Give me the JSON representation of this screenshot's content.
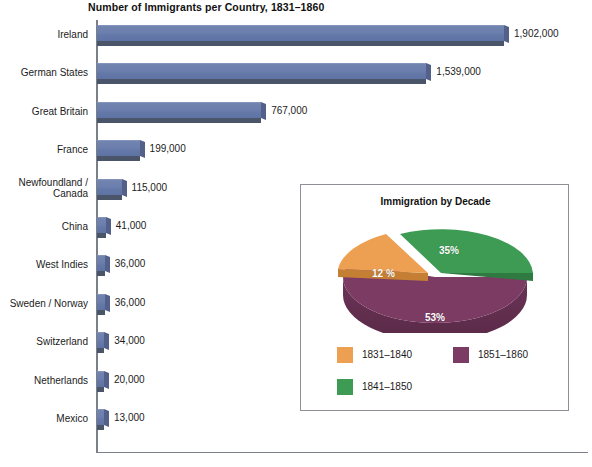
{
  "chart_data": [
    {
      "type": "bar",
      "orientation": "horizontal",
      "title": "Number of Immigrants per Country, 1831–1860",
      "xlabel": "",
      "ylabel": "",
      "categories": [
        "Ireland",
        "German States",
        "Great Britain",
        "France",
        "Newfoundland /\nCanada",
        "China",
        "West Indies",
        "Sweden / Norway",
        "Switzerland",
        "Netherlands",
        "Mexico"
      ],
      "values": [
        1902000,
        1539000,
        767000,
        199000,
        115000,
        41000,
        36000,
        36000,
        34000,
        20000,
        13000
      ],
      "value_labels": [
        "1,902,000",
        "1,539,000",
        "767,000",
        "199,000",
        "115,000",
        "41,000",
        "36,000",
        "36,000",
        "34,000",
        "20,000",
        "13,000"
      ],
      "xlim": [
        0,
        2000000
      ],
      "grid": false,
      "bar_color": "#6B7EAD",
      "bar_shadow_color": "#4B5569"
    },
    {
      "type": "pie",
      "title": "Immigration by Decade",
      "labels": [
        "1831–1840",
        "1841–1850",
        "1851–1860"
      ],
      "values": [
        12,
        35,
        53
      ],
      "value_labels": [
        "12 %",
        "35%",
        "53%"
      ],
      "colors": [
        "#EDA052",
        "#3D9B54",
        "#7B3B63"
      ],
      "legend_position": "bottom",
      "exploded": [
        "1831–1840",
        "1841–1850"
      ]
    }
  ],
  "main": {
    "title": "Number of Immigrants per Country, 1831–1860",
    "bars": [
      {
        "label": "Ireland",
        "label_line1": "Ireland",
        "label_line2": "",
        "value": "1,902,000",
        "num": 1902000
      },
      {
        "label": "German States",
        "label_line1": "German States",
        "label_line2": "",
        "value": "1,539,000",
        "num": 1539000
      },
      {
        "label": "Great Britain",
        "label_line1": "Great Britain",
        "label_line2": "",
        "value": "767,000",
        "num": 767000
      },
      {
        "label": "France",
        "label_line1": "France",
        "label_line2": "",
        "value": "199,000",
        "num": 199000
      },
      {
        "label": "Newfoundland / Canada",
        "label_line1": "Newfoundland /",
        "label_line2": "Canada",
        "value": "115,000",
        "num": 115000
      },
      {
        "label": "China",
        "label_line1": "China",
        "label_line2": "",
        "value": "41,000",
        "num": 41000
      },
      {
        "label": "West Indies",
        "label_line1": "West Indies",
        "label_line2": "",
        "value": "36,000",
        "num": 36000
      },
      {
        "label": "Sweden / Norway",
        "label_line1": "Sweden / Norway",
        "label_line2": "",
        "value": "36,000",
        "num": 36000
      },
      {
        "label": "Switzerland",
        "label_line1": "Switzerland",
        "label_line2": "",
        "value": "34,000",
        "num": 34000
      },
      {
        "label": "Netherlands",
        "label_line1": "Netherlands",
        "label_line2": "",
        "value": "20,000",
        "num": 20000
      },
      {
        "label": "Mexico",
        "label_line1": "Mexico",
        "label_line2": "",
        "value": "13,000",
        "num": 13000
      }
    ]
  },
  "inset": {
    "title": "Immigration by Decade",
    "slices": [
      {
        "label": "1831–1840",
        "pct": "12 %",
        "value": 12,
        "color": "#EDA052"
      },
      {
        "label": "1841–1850",
        "pct": "35%",
        "value": 35,
        "color": "#3D9B54"
      },
      {
        "label": "1851–1860",
        "pct": "53%",
        "value": 53,
        "color": "#7B3B63"
      }
    ],
    "legend": [
      {
        "label": "1831–1840",
        "color": "#EDA052"
      },
      {
        "label": "1841–1850",
        "color": "#3D9B54"
      },
      {
        "label": "1851–1860",
        "color": "#7B3B63"
      }
    ]
  }
}
